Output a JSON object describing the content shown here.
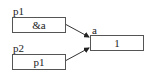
{
  "diagram": {
    "nodes": [
      {
        "id": "p1",
        "label": "p1",
        "value": "&a"
      },
      {
        "id": "p2",
        "label": "p2",
        "value": "p1"
      },
      {
        "id": "a",
        "label": "a",
        "value": "1"
      }
    ],
    "edges": [
      {
        "from": "p1",
        "to": "a"
      },
      {
        "from": "p2",
        "to": "a"
      }
    ]
  }
}
